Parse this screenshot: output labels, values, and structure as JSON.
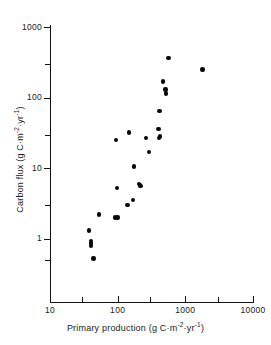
{
  "chart_data": {
    "type": "scatter",
    "title": "",
    "xlabel": "Primary production (g C·m⁻²·yr⁻¹)",
    "ylabel": "Carbon flux (g C·m⁻²·yr⁻¹)",
    "xscale": "log",
    "yscale": "log",
    "xlim": [
      10,
      10000
    ],
    "ylim": [
      0.3,
      1000
    ],
    "grid": false,
    "legend": null,
    "xticks": [
      10,
      100,
      1000,
      10000
    ],
    "xtick_labels": [
      "10",
      "100",
      "1000",
      "10000"
    ],
    "yticks": [
      1,
      10,
      100,
      1000
    ],
    "ytick_labels": [
      "1",
      "10",
      "100",
      "1000"
    ],
    "x_minor_ticks": [
      30,
      300,
      3000
    ],
    "y_minor_ticks": [
      0.5,
      3,
      30,
      300
    ],
    "marker": "filled-circle",
    "marker_color": "#080808",
    "points": [
      {
        "x": 38,
        "y": 1.3
      },
      {
        "x": 40,
        "y": 0.92
      },
      {
        "x": 40,
        "y": 0.85
      },
      {
        "x": 40,
        "y": 0.78
      },
      {
        "x": 44,
        "y": 0.52
      },
      {
        "x": 53,
        "y": 2.2
      },
      {
        "x": 92,
        "y": 2.0
      },
      {
        "x": 99,
        "y": 2.0
      },
      {
        "x": 95,
        "y": 25
      },
      {
        "x": 97,
        "y": 5.2
      },
      {
        "x": 140,
        "y": 3.0
      },
      {
        "x": 146,
        "y": 32
      },
      {
        "x": 170,
        "y": 3.5
      },
      {
        "x": 175,
        "y": 10.5
      },
      {
        "x": 205,
        "y": 6.0
      },
      {
        "x": 215,
        "y": 5.7
      },
      {
        "x": 218,
        "y": 5.6
      },
      {
        "x": 260,
        "y": 27
      },
      {
        "x": 290,
        "y": 17
      },
      {
        "x": 400,
        "y": 36
      },
      {
        "x": 410,
        "y": 27
      },
      {
        "x": 420,
        "y": 28
      },
      {
        "x": 415,
        "y": 65
      },
      {
        "x": 470,
        "y": 170
      },
      {
        "x": 510,
        "y": 130
      },
      {
        "x": 515,
        "y": 115
      },
      {
        "x": 560,
        "y": 370
      },
      {
        "x": 1800,
        "y": 250
      }
    ]
  },
  "axes": {
    "x_label_parts": {
      "text": "Primary production (g C·m",
      "sup1": "-2",
      "mid": "·yr",
      "sup2": "-1",
      "close": ")"
    },
    "y_label_parts": {
      "text": "Carbon flux (g C·m",
      "sup1": "-2",
      "mid": "·yr",
      "sup2": "-1",
      "close": ")"
    },
    "x_ticks": [
      {
        "label": "10",
        "value": 10,
        "major": true
      },
      {
        "label": "",
        "value": 30,
        "major": false
      },
      {
        "label": "100",
        "value": 100,
        "major": true
      },
      {
        "label": "",
        "value": 300,
        "major": false
      },
      {
        "label": "1000",
        "value": 1000,
        "major": true
      },
      {
        "label": "",
        "value": 3000,
        "major": false
      },
      {
        "label": "10000",
        "value": 10000,
        "major": true
      }
    ],
    "y_ticks": [
      {
        "label": "1000",
        "value": 1000,
        "major": true
      },
      {
        "label": "",
        "value": 300,
        "major": false
      },
      {
        "label": "100",
        "value": 100,
        "major": true
      },
      {
        "label": "",
        "value": 30,
        "major": false
      },
      {
        "label": "10",
        "value": 10,
        "major": true
      },
      {
        "label": "",
        "value": 3,
        "major": false
      },
      {
        "label": "1",
        "value": 1,
        "major": true
      },
      {
        "label": "",
        "value": 0.5,
        "major": false
      }
    ]
  },
  "colors": {
    "axis": "#141414",
    "marker": "#080808",
    "background": "#ffffff"
  }
}
